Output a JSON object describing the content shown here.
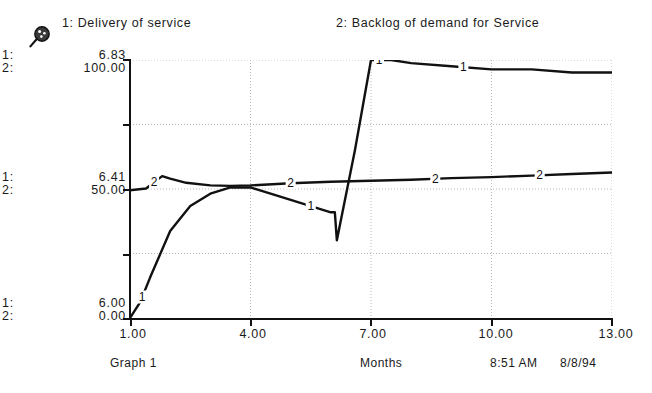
{
  "window": {
    "title": "Graph 1"
  },
  "toolbar": {
    "magnifier_icon": "magnifier-icon",
    "padlock_icon": "padlock-open-icon"
  },
  "legend": {
    "entries": [
      {
        "id": "1",
        "label": "1: Delivery of service"
      },
      {
        "id": "2",
        "label": "2: Backlog of demand for Service"
      }
    ]
  },
  "y_axis_labels": {
    "top": [
      {
        "id": "1:",
        "value": "6.83"
      },
      {
        "id": "2:",
        "value": "100.00"
      }
    ],
    "middle": [
      {
        "id": "1:",
        "value": "6.41"
      },
      {
        "id": "2:",
        "value": "50.00"
      }
    ],
    "bottom": [
      {
        "id": "1:",
        "value": "6.00"
      },
      {
        "id": "2:",
        "value": "0.00"
      }
    ]
  },
  "x_axis_labels": [
    "1.00",
    "4.00",
    "7.00",
    "10.00",
    "13.00"
  ],
  "status": {
    "graph_name": "Graph 1",
    "x_axis_name": "Months",
    "time": "8:51  AM",
    "date": "8/8/94"
  },
  "colors": {
    "line": "#111111",
    "grid": "#b9b9b9",
    "axis": "#111111",
    "background": "#ffffff"
  },
  "chart_data": {
    "type": "line",
    "title": "",
    "subtitle": "",
    "xlabel": "Months",
    "ylabel": "",
    "grid": true,
    "legend_position": "top",
    "xlim": [
      1.0,
      13.0
    ],
    "xticks": [
      1.0,
      4.0,
      7.0,
      10.0,
      13.0
    ],
    "yaxes": [
      {
        "series_id": "1",
        "name": "Delivery of service",
        "ylim": [
          6.0,
          6.83
        ],
        "yticks": [
          6.0,
          6.41,
          6.83
        ]
      },
      {
        "series_id": "2",
        "name": "Backlog of demand for Service",
        "ylim": [
          0.0,
          100.0
        ],
        "yticks": [
          0.0,
          50.0,
          100.0
        ]
      }
    ],
    "series": [
      {
        "name": "Delivery of service",
        "id": "1",
        "axis": 1,
        "marker_labels_at_x": [
          1.3,
          5.5,
          7.2,
          9.3
        ],
        "x": [
          1.0,
          1.25,
          1.5,
          2.0,
          2.5,
          3.0,
          3.5,
          4.0,
          4.5,
          5.0,
          5.5,
          6.0,
          6.1,
          6.15,
          6.6,
          7.0,
          7.5,
          8.0,
          9.0,
          10.0,
          11.0,
          12.0,
          13.0
        ],
        "y": [
          6.0,
          6.05,
          6.13,
          6.28,
          6.36,
          6.4,
          6.42,
          6.42,
          6.4,
          6.38,
          6.36,
          6.34,
          6.34,
          6.25,
          6.54,
          6.83,
          6.83,
          6.82,
          6.81,
          6.8,
          6.8,
          6.79,
          6.79
        ]
      },
      {
        "name": "Backlog of demand for Service",
        "id": "2",
        "axis": 2,
        "marker_labels_at_x": [
          1.6,
          5.0,
          8.6,
          11.2
        ],
        "x": [
          1.0,
          1.4,
          1.8,
          2.0,
          2.4,
          3.0,
          3.5,
          4.0,
          5.0,
          6.0,
          7.0,
          8.0,
          9.0,
          10.0,
          11.0,
          12.0,
          13.0
        ],
        "y": [
          49.5,
          50.2,
          55.0,
          54.0,
          52.4,
          51.4,
          51.2,
          51.4,
          52.2,
          52.8,
          53.2,
          53.6,
          54.2,
          54.6,
          55.2,
          55.8,
          56.4
        ]
      }
    ]
  }
}
